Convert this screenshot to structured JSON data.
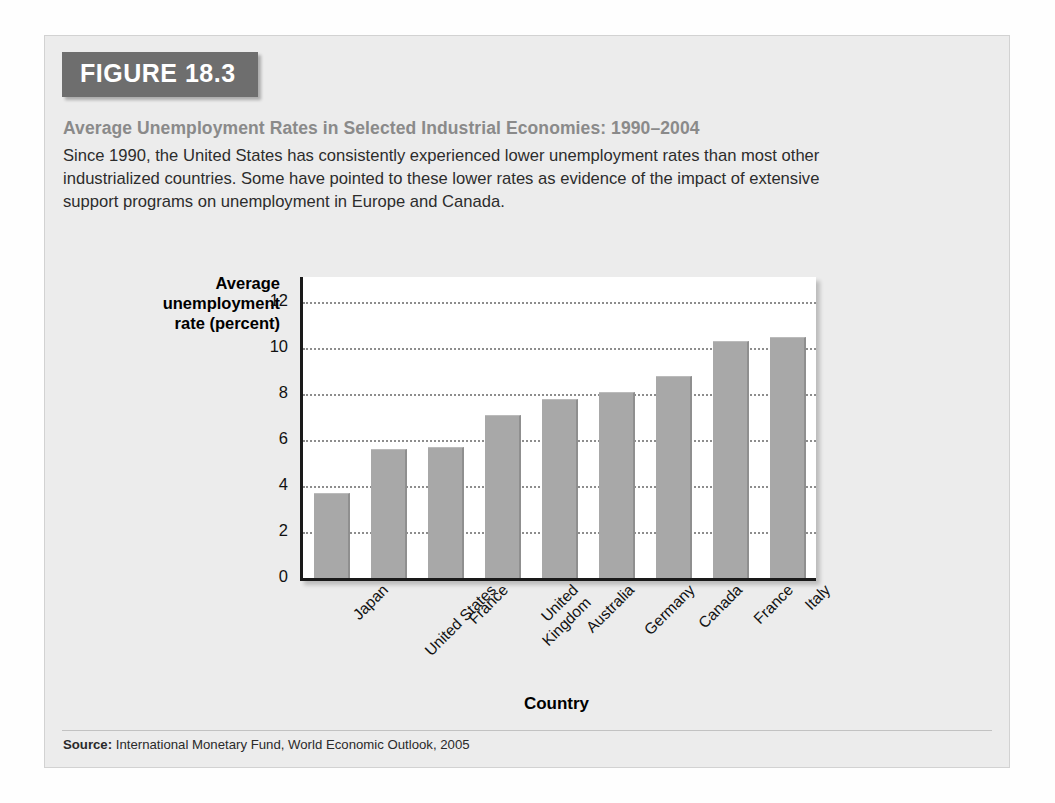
{
  "figure": {
    "badge": "FIGURE 18.3",
    "title": "Average Unemployment Rates in Selected Industrial Economies: 1990–2004",
    "description": "Since 1990, the United States has consistently experienced lower unemployment rates than most other industrialized countries. Some have pointed to these lower rates as evidence of the impact of extensive support programs on unemployment in Europe and Canada.",
    "source_label": "Source:",
    "source_text": "International Monetary Fund, World Economic Outlook, 2005",
    "badge_color": "#6e6e6e",
    "title_color": "#8a8a8a",
    "card_background": "#ececec",
    "bar_color": "#a8a8a8"
  },
  "chart_data": {
    "type": "bar",
    "title": "Average Unemployment Rates in Selected Industrial Economies: 1990–2004",
    "categories": [
      "Japan",
      "United States",
      "France",
      "United Kingdom",
      "Australia",
      "Germany",
      "Canada",
      "France",
      "Italy"
    ],
    "values": [
      3.7,
      5.6,
      5.7,
      7.1,
      7.8,
      8.1,
      8.8,
      10.3,
      10.5
    ],
    "xlabel": "Country",
    "ylabel": "Average unemployment rate (percent)",
    "ylabel_lines": [
      "Average",
      "unemployment",
      "rate (percent)"
    ],
    "ylim": [
      0,
      13.1
    ],
    "yticks": [
      0,
      2,
      4,
      6,
      8,
      10,
      12
    ],
    "ytick_labels": [
      "0",
      "2",
      "4",
      "6",
      "8",
      "10",
      "12"
    ],
    "grid": true,
    "grid_style": "dotted-horizontal",
    "legend": null
  }
}
